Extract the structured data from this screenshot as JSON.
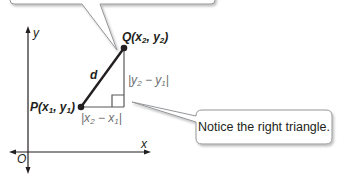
{
  "diagram": {
    "axes": {
      "x_label": "x",
      "y_label": "y",
      "origin_label": "O"
    },
    "points": {
      "P": {
        "name": "P",
        "x_sub": "1",
        "y_sub": "1"
      },
      "Q": {
        "name": "Q",
        "x_sub": "2",
        "y_sub": "2"
      }
    },
    "segment_label": "d",
    "vertical_leg_label": {
      "open": "|y",
      "sub_a": "2",
      "mid": " − y",
      "sub_b": "1",
      "close": "|"
    },
    "horizontal_leg_label": {
      "open": "|x",
      "sub_a": "2",
      "mid": " − x",
      "sub_b": "1",
      "close": "|"
    },
    "callouts": [
      {
        "text": "Notice the right triangle."
      }
    ],
    "colors": {
      "line": "#231f20",
      "leg": "#58595b",
      "callout_border": "#939598",
      "leg_label": "#6d6e71"
    }
  }
}
